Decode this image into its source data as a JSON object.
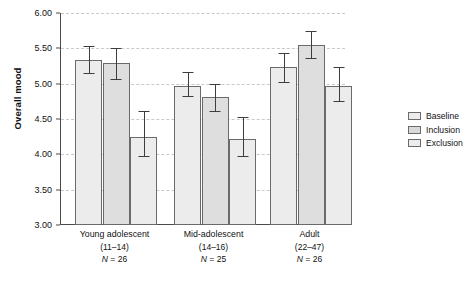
{
  "chart_data": {
    "type": "bar",
    "title": "",
    "xlabel": "",
    "ylabel": "Overall mood",
    "ylim": [
      3.0,
      6.0
    ],
    "ytick_labels": [
      "6.00",
      "5.50",
      "5.00",
      "4.50",
      "4.00",
      "3.50",
      "3.00"
    ],
    "ytick_values": [
      6.0,
      5.5,
      5.0,
      4.5,
      4.0,
      3.5,
      3.0
    ],
    "grid": true,
    "grid_style": "dashed horizontal",
    "legend_position": "right",
    "categories": [
      "Young adolescent",
      "Mid-adolescent",
      "Adult"
    ],
    "category_details": [
      {
        "name": "Young adolescent",
        "age_range": "(11–14)",
        "n_label": "N = 26"
      },
      {
        "name": "Mid-adolescent",
        "age_range": "(14–16)",
        "n_label": "N = 25"
      },
      {
        "name": "Adult",
        "age_range": "(22–47)",
        "n_label": "N = 26"
      }
    ],
    "series": [
      {
        "name": "Baseline",
        "values": [
          5.34,
          4.97,
          5.24
        ],
        "err_low": [
          5.15,
          4.83,
          5.03
        ],
        "err_high": [
          5.54,
          5.17,
          5.44
        ]
      },
      {
        "name": "Inclusion",
        "values": [
          5.29,
          4.81,
          5.55
        ],
        "err_low": [
          5.07,
          4.62,
          5.36
        ],
        "err_high": [
          5.5,
          5.0,
          5.75
        ]
      },
      {
        "name": "Exclusion",
        "values": [
          4.24,
          4.22,
          4.96
        ],
        "err_low": [
          3.98,
          3.97,
          4.75
        ],
        "err_high": [
          4.62,
          4.53,
          5.24
        ]
      }
    ]
  },
  "legend": {
    "items": [
      {
        "label": "Baseline",
        "swatch_class": "baseline",
        "color": "#ececed"
      },
      {
        "label": "Inclusion",
        "swatch_class": "inclusion",
        "color": "#d9d9d9"
      },
      {
        "label": "Exclusion",
        "swatch_class": "exclusion",
        "color": "#ececed"
      }
    ]
  },
  "axis": {
    "y_title": "Overall mood",
    "axis_color": "#4a4a4a",
    "grid_color": "#c9c9c9"
  }
}
